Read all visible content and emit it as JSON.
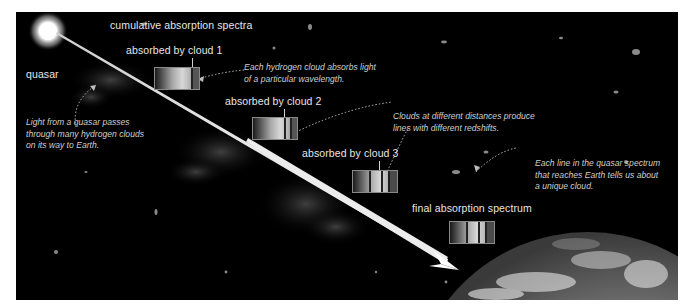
{
  "diagram": {
    "title": "cumulative absorption spectra",
    "source_label": "quasar",
    "spectra": [
      {
        "label": "absorbed by cloud 1",
        "absorption_lines": 1
      },
      {
        "label": "absorbed by cloud 2",
        "absorption_lines": 2
      },
      {
        "label": "absorbed by cloud 3",
        "absorption_lines": 3
      },
      {
        "label": "final absorption spectrum",
        "absorption_lines": 3
      }
    ],
    "annotations": {
      "light_path": [
        "Light from a quasar passes",
        "through many hydrogen clouds",
        "on its way to Earth."
      ],
      "cloud_absorbs": [
        "Each hydrogen cloud absorbs light",
        "of a particular wavelength."
      ],
      "redshifts": [
        "Clouds at different distances produce",
        "lines with different redshifts."
      ],
      "unique_cloud": [
        "Each line in the quasar spectrum",
        "that reaches Earth tells us about",
        "a unique cloud."
      ]
    },
    "destination_label": "Earth",
    "colors": {
      "background": "#000000",
      "text": "#e6e6e6",
      "beam": "#f2f2f2",
      "frame": "#ffffff"
    }
  }
}
